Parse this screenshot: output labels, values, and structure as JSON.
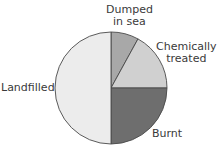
{
  "chart_data": {
    "type": "pie",
    "title": "",
    "categories": [
      "Landfilled",
      "Dumped in sea",
      "Chemically treated",
      "Burnt"
    ],
    "values": [
      50,
      8,
      17,
      25
    ],
    "unit": "%",
    "colors": [
      "#ececec",
      "#a8a8a8",
      "#d0d0d0",
      "#6e6e6e"
    ],
    "start_angle_deg": 0,
    "direction": "clockwise from top",
    "slice_order": [
      "Dumped in sea",
      "Chemically treated",
      "Burnt",
      "Landfilled"
    ],
    "legend": "none (direct labels)"
  },
  "labels": {
    "dumped_line1": "Dumped",
    "dumped_line2": "in sea",
    "chemical_line1": "Chemically",
    "chemical_line2": "treated",
    "landfilled": "Landfilled",
    "burnt": "Burnt"
  }
}
